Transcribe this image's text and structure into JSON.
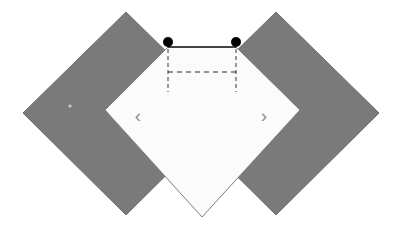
{
  "figure": {
    "canvas": {
      "width": 399,
      "height": 232,
      "background": "#ffffff"
    },
    "colors": {
      "diamond_fill": "#7a7a7a",
      "diamond_stroke": "#6e6e6e",
      "center_fill": "#fbfbfb",
      "center_stroke": "#7d7d7d",
      "line": "#1a1a1a",
      "dashed_line": "#4a4a4a",
      "marker_fill": "#000000",
      "chevron": "#8e8e8e",
      "dot_fill": "#c9c9c9"
    },
    "shapes": {
      "left_diamond": {
        "name": "left-gray-diamond",
        "points": "23,113 126,12 229,113 126,215"
      },
      "right_diamond": {
        "name": "right-gray-diamond",
        "points": "173,113 276,12 379,113 276,215"
      },
      "center_plate": {
        "name": "center-light-plate",
        "points": "105,110 168,47 236,47 300,110 202,217"
      }
    },
    "markers": [
      {
        "name": "left-endpoint-dot",
        "cx": 168,
        "cy": 42,
        "r": 5,
        "label": ""
      },
      {
        "name": "right-endpoint-dot",
        "cx": 236,
        "cy": 42,
        "r": 5,
        "label": ""
      }
    ],
    "solid_segment": {
      "name": "top-solid-span",
      "x1": 168,
      "y1": 47,
      "x2": 236,
      "y2": 47
    },
    "dashed_segment": {
      "name": "offset-dashed-span",
      "x1": 168,
      "y1": 72,
      "x2": 236,
      "y2": 72,
      "dash_pattern": "5 4"
    },
    "drop_lines": [
      {
        "name": "left-drop-line",
        "x": 168,
        "y1": 42,
        "y2": 92
      },
      {
        "name": "right-drop-line",
        "x": 236,
        "y1": 42,
        "y2": 92
      }
    ],
    "chevrons": [
      {
        "name": "left-chevron-mark",
        "glyph": "‹",
        "x": 138,
        "y": 117
      },
      {
        "name": "right-chevron-mark",
        "glyph": "›",
        "x": 264,
        "y": 117
      }
    ],
    "center_dot": {
      "name": "left-diamond-center-dot",
      "cx": 70,
      "cy": 106,
      "r": 1.6
    }
  }
}
